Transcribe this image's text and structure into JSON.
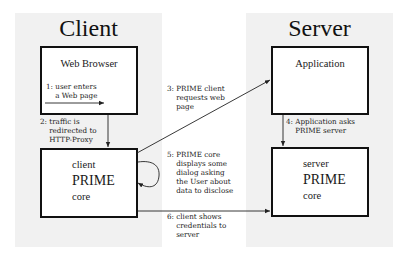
{
  "panels": {
    "client": {
      "title": "Client"
    },
    "server": {
      "title": "Server"
    }
  },
  "boxes": {
    "web_browser": {
      "title": "Web Browser"
    },
    "client_core": {
      "line1": "client",
      "line2": "PRIME",
      "line3": "core"
    },
    "application": {
      "title": "Application"
    },
    "server_core": {
      "line1": "server",
      "line2": "PRIME",
      "line3": "core"
    }
  },
  "steps": [
    {
      "number": "1",
      "text": "1: user enters\n    a Web page"
    },
    {
      "number": "2",
      "text": "2: traffic is\n    redirected to\n    HTTP-Proxy"
    },
    {
      "number": "3",
      "text": "3: PRIME client\n    requests web\n    page"
    },
    {
      "number": "4",
      "text": "4: Application asks\n    PRIME server"
    },
    {
      "number": "5",
      "text": "5: PRIME core\n    displays some\n    dialog asking\n    the User about\n    data to disclose"
    },
    {
      "number": "6",
      "text": "6: client shows\n    credentials to\n    server"
    }
  ],
  "colors": {
    "panel_bg": "#f1f1f1",
    "box_border": "#111111",
    "line": "#222222"
  }
}
